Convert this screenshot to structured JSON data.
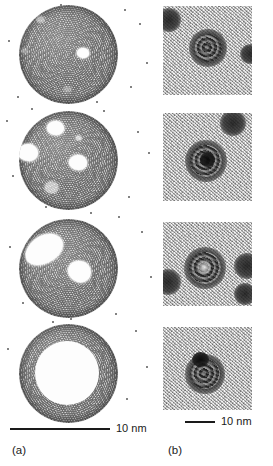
{
  "figure": {
    "width": 273,
    "height": 466,
    "background": "#ffffff"
  },
  "panels": [
    {
      "id": "a",
      "label": "(a)",
      "label_x": 12,
      "label_y": 445,
      "kind": "molecular-dynamics-simulation",
      "scalebar": {
        "text": "10 nm",
        "x": 10,
        "y": 428,
        "length": 100,
        "label_x": 116,
        "label_y": 423
      },
      "frames": [
        {
          "index": 0,
          "stage": "solid-particle-single-small-void",
          "sphere": {
            "cx": 68,
            "cy": 54,
            "d": 99
          },
          "voids": [
            {
              "x": 83,
              "y": 58,
              "w": 12,
              "h": 10,
              "opacity": 1
            },
            {
              "x": 40,
              "y": 24,
              "w": 7,
              "h": 5,
              "opacity": 0.5
            },
            {
              "x": 24,
              "y": 57,
              "w": 5,
              "h": 4,
              "opacity": 0.35
            }
          ]
        },
        {
          "index": 1,
          "stage": "multiple-discrete-voids",
          "sphere": {
            "cx": 68,
            "cy": 160,
            "d": 99
          },
          "voids": [
            {
              "x": 55,
              "y": 128,
              "w": 17,
              "h": 14,
              "opacity": 1
            },
            {
              "x": 26,
              "y": 152,
              "w": 20,
              "h": 17,
              "opacity": 1
            },
            {
              "x": 77,
              "y": 163,
              "w": 18,
              "h": 15,
              "opacity": 1
            },
            {
              "x": 53,
              "y": 190,
              "w": 13,
              "h": 11,
              "opacity": 0.65
            }
          ]
        },
        {
          "index": 2,
          "stage": "voids-coalescing",
          "sphere": {
            "cx": 68,
            "cy": 268,
            "d": 99
          },
          "voids": [
            {
              "x": 30,
              "y": 240,
              "w": 38,
              "h": 26,
              "opacity": 1,
              "rotate": -32
            },
            {
              "x": 74,
              "y": 268,
              "w": 22,
              "h": 20,
              "opacity": 1,
              "rotate": 18
            }
          ]
        },
        {
          "index": 3,
          "stage": "hollow-shell",
          "sphere": {
            "cx": 68,
            "cy": 373,
            "d": 99
          },
          "core": {
            "cx": 66,
            "cy": 373,
            "d": 63
          }
        }
      ]
    },
    {
      "id": "b",
      "label": "(b)",
      "label_x": 168,
      "label_y": 445,
      "kind": "tem-micrograph",
      "scalebar": {
        "text": "10 nm",
        "x": 185,
        "y": 421,
        "length": 30,
        "label_x": 221,
        "label_y": 416
      },
      "frames": [
        {
          "index": 0,
          "x": 163,
          "y": 6,
          "w": 89,
          "h": 89,
          "particles": [
            {
              "cx": 45,
              "cy": 42,
              "d": 38,
              "type": "mottled"
            },
            {
              "cx": 6,
              "cy": 14,
              "d": 24,
              "type": "plain"
            },
            {
              "cx": 87,
              "cy": 48,
              "d": 20,
              "type": "plain"
            }
          ]
        },
        {
          "index": 1,
          "x": 163,
          "y": 113,
          "w": 89,
          "h": 88,
          "particles": [
            {
              "cx": 43,
              "cy": 48,
              "d": 42,
              "type": "mottled"
            },
            {
              "cx": 70,
              "cy": 10,
              "d": 26,
              "type": "plain"
            }
          ],
          "core": {
            "cx": 45,
            "cy": 46,
            "d": 15
          }
        },
        {
          "index": 2,
          "x": 163,
          "y": 222,
          "w": 89,
          "h": 84,
          "particles": [
            {
              "cx": 42,
              "cy": 46,
              "d": 42,
              "type": "mottled"
            },
            {
              "cx": 5,
              "cy": 60,
              "d": 26,
              "type": "plain"
            },
            {
              "cx": 84,
              "cy": 44,
              "d": 26,
              "type": "plain"
            },
            {
              "cx": 82,
              "cy": 72,
              "d": 22,
              "type": "plain"
            }
          ],
          "lucent": {
            "cx": 42,
            "cy": 46,
            "d": 13
          }
        },
        {
          "index": 3,
          "x": 163,
          "y": 327,
          "w": 89,
          "h": 83,
          "particles": [
            {
              "cx": 42,
              "cy": 47,
              "d": 40,
              "type": "mottled"
            }
          ],
          "core": {
            "cx": 38,
            "cy": 34,
            "d": 17
          }
        }
      ]
    }
  ],
  "stray_atoms": [
    {
      "x": 124,
      "y": 9
    },
    {
      "x": 139,
      "y": 23
    },
    {
      "x": 8,
      "y": 40
    },
    {
      "x": 146,
      "y": 62
    },
    {
      "x": 130,
      "y": 86
    },
    {
      "x": 17,
      "y": 96
    },
    {
      "x": 60,
      "y": 4
    },
    {
      "x": 96,
      "y": 101
    },
    {
      "x": 6,
      "y": 120
    },
    {
      "x": 137,
      "y": 131
    },
    {
      "x": 148,
      "y": 152
    },
    {
      "x": 12,
      "y": 175
    },
    {
      "x": 128,
      "y": 196
    },
    {
      "x": 45,
      "y": 206
    },
    {
      "x": 90,
      "y": 212
    },
    {
      "x": 141,
      "y": 231
    },
    {
      "x": 9,
      "y": 246
    },
    {
      "x": 150,
      "y": 276
    },
    {
      "x": 22,
      "y": 302
    },
    {
      "x": 115,
      "y": 313
    },
    {
      "x": 135,
      "y": 330
    },
    {
      "x": 7,
      "y": 348
    },
    {
      "x": 146,
      "y": 366
    },
    {
      "x": 126,
      "y": 398
    },
    {
      "x": 52,
      "y": 321
    },
    {
      "x": 103,
      "y": 110
    },
    {
      "x": 31,
      "y": 108
    },
    {
      "x": 118,
      "y": 216
    },
    {
      "x": 70,
      "y": 318
    },
    {
      "x": 88,
      "y": 411
    }
  ]
}
